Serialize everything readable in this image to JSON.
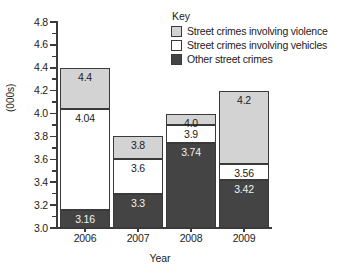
{
  "chart_data": {
    "type": "bar",
    "stacked": true,
    "title": "",
    "xlabel": "Year",
    "ylabel": "(000s)",
    "categories": [
      "2006",
      "2007",
      "2008",
      "2009"
    ],
    "ylim": [
      3.0,
      4.8
    ],
    "ytick_step": 0.2,
    "yminor_step": 0.1,
    "ytick_labels": [
      "3.0",
      "3.2",
      "3.4",
      "3.6",
      "3.8",
      "4.0",
      "4.2",
      "4.4",
      "4.6",
      "4.8"
    ],
    "grid": false,
    "legend_position": "top-right",
    "legend_title": "Key",
    "series": [
      {
        "name": "Other street crimes",
        "color": "#444444",
        "cumulative_tops": [
          3.16,
          3.3,
          3.74,
          3.42
        ],
        "values": [
          0.16,
          0.3,
          0.74,
          0.42
        ],
        "labels": [
          "3.16",
          "3.3",
          "3.74",
          "3.42"
        ]
      },
      {
        "name": "Street crimes involving vehicles",
        "color": "#ffffff",
        "cumulative_tops": [
          4.04,
          3.6,
          3.9,
          3.56
        ],
        "values": [
          0.88,
          0.3,
          0.16,
          0.14
        ],
        "labels": [
          "4.04",
          "3.6",
          "3.9",
          "3.56"
        ]
      },
      {
        "name": "Street crimes involving violence",
        "color": "#d3d3d3",
        "cumulative_tops": [
          4.4,
          3.8,
          4.0,
          4.2
        ],
        "values": [
          0.36,
          0.2,
          0.1,
          0.64
        ],
        "labels": [
          "4.4",
          "3.8",
          "4.0",
          "4.2"
        ]
      }
    ]
  },
  "axes": {
    "y_title": "(000s)",
    "x_title": "Year",
    "y_ticks": [
      "4.8",
      "4.6",
      "4.4",
      "4.2",
      "4.0",
      "3.8",
      "3.6",
      "3.4",
      "3.2",
      "3.0"
    ],
    "x_ticks": [
      "2006",
      "2007",
      "2008",
      "2009"
    ]
  },
  "legend": {
    "title": "Key",
    "items": [
      {
        "label": "Street crimes involving violence",
        "color": "#d3d3d3"
      },
      {
        "label": "Street crimes involving vehicles",
        "color": "#ffffff"
      },
      {
        "label": "Other street crimes",
        "color": "#444444"
      }
    ]
  },
  "bars": [
    {
      "category": "2006",
      "segments": [
        {
          "key": "other",
          "label": "3.16"
        },
        {
          "key": "vehicles",
          "label": "4.04"
        },
        {
          "key": "violence",
          "label": "4.4"
        }
      ]
    },
    {
      "category": "2007",
      "segments": [
        {
          "key": "other",
          "label": "3.3"
        },
        {
          "key": "vehicles",
          "label": "3.6"
        },
        {
          "key": "violence",
          "label": "3.8"
        }
      ]
    },
    {
      "category": "2008",
      "segments": [
        {
          "key": "other",
          "label": "3.74"
        },
        {
          "key": "vehicles",
          "label": "3.9"
        },
        {
          "key": "violence",
          "label": "4.0"
        }
      ]
    },
    {
      "category": "2009",
      "segments": [
        {
          "key": "other",
          "label": "3.42"
        },
        {
          "key": "vehicles",
          "label": "3.56"
        },
        {
          "key": "violence",
          "label": "4.2"
        }
      ]
    }
  ]
}
